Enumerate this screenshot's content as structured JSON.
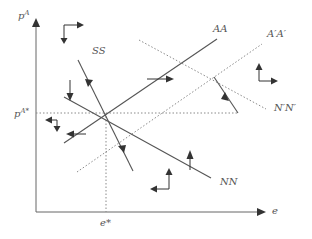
{
  "diagram": {
    "axes": {
      "y_label": "p",
      "y_label_sup": "A",
      "x_label": "e",
      "y_eq_label": "p",
      "y_eq_label_sup": "A*",
      "x_eq_label": "e*"
    },
    "curves": {
      "ss": "SS",
      "aa": "AA",
      "a_prime": "A′A′",
      "nn": "NN",
      "n_prime": "N′N′"
    },
    "colors": {
      "line": "#555555",
      "dotted": "#8a8a8a",
      "text": "#555555"
    }
  }
}
